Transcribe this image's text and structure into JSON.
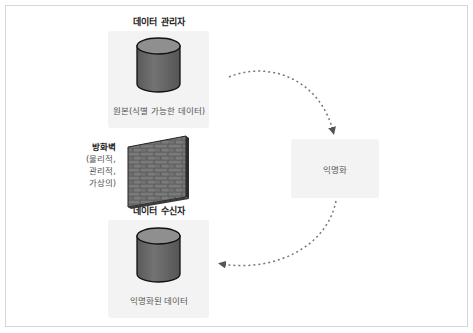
{
  "diagram": {
    "nodes": {
      "data_controller": {
        "title": "데이터 관리자",
        "caption": "원본(식별 가능한 데이터)",
        "icon": "database-cylinder-icon"
      },
      "anonymization": {
        "caption": "익명화"
      },
      "data_recipient": {
        "title": "데이터 수신자",
        "caption": "익명화된 데이터",
        "icon": "database-cylinder-icon"
      }
    },
    "firewall": {
      "title": "방화벽",
      "lines": [
        "(물리적,",
        "관리적,",
        "가상의)"
      ],
      "icon": "brick-wall-icon"
    },
    "edges": [
      {
        "from": "data_controller",
        "to": "anonymization",
        "style": "dotted-arrow"
      },
      {
        "from": "anonymization",
        "to": "data_recipient",
        "style": "dotted-arrow"
      }
    ],
    "colors": {
      "box_fill": "#f3f3f3",
      "cylinder_top": "#8c8c8c",
      "cylinder_body": "#6a6a6a",
      "edge": "#777777",
      "frame": "#d6d6d6"
    }
  }
}
